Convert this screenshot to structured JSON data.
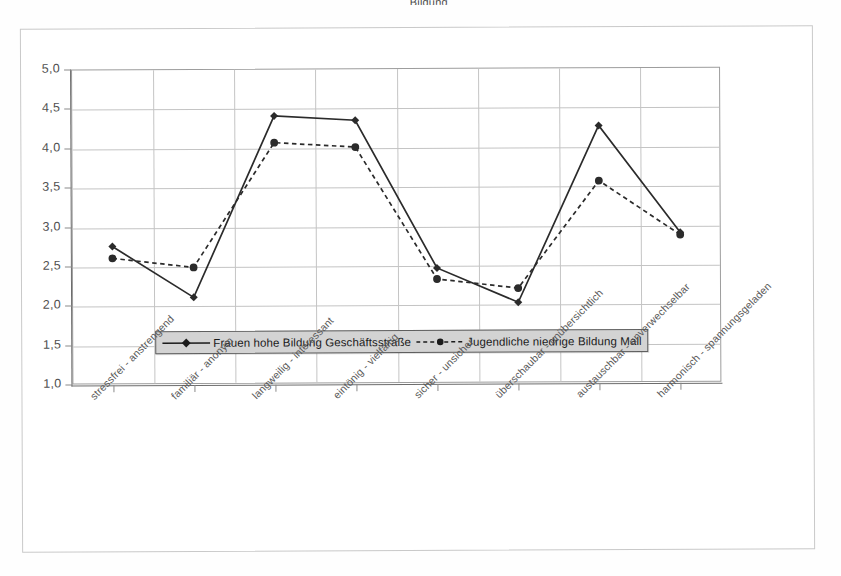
{
  "title_fragment": "Bildung",
  "axis": {
    "y_ticks": [
      "5,0",
      "4,5",
      "4,0",
      "3,5",
      "3,0",
      "2,5",
      "2,0",
      "1,5",
      "1,0"
    ],
    "y_min": 1.0,
    "y_max": 5.0,
    "y_step": 0.5
  },
  "legend": {
    "series1_label": "Frauen hohe Bildung Geschäftsstraße",
    "series2_label": "Jugendliche niedrige Bildung Mall"
  },
  "chart_data": {
    "type": "line",
    "title": "",
    "subtitle": "",
    "xlabel": "",
    "ylabel": "",
    "ylim": [
      1.0,
      5.0
    ],
    "ytick_step": 0.5,
    "ytick_labels": [
      "1,0",
      "1,5",
      "2,0",
      "2,5",
      "3,0",
      "3,5",
      "4,0",
      "4,5",
      "5,0"
    ],
    "grid": "both",
    "legend_position": "inside-center-lower",
    "categories": [
      "stressfrei - anstrengend",
      "familiär - anonym",
      "langweilig - interessant",
      "eintönig - vielfältig",
      "sicher - unsicher",
      "überschaubar - unübersichtlich",
      "austauschbar - unverwechselbar",
      "harmonisch - spannungsgeladen"
    ],
    "series": [
      {
        "name": "Frauen hohe Bildung Geschäftsstraße",
        "style": "solid",
        "marker": "diamond",
        "color": "#2b2b2b",
        "values": [
          2.75,
          2.1,
          4.4,
          4.34,
          2.46,
          2.02,
          4.26,
          2.9
        ]
      },
      {
        "name": "Jugendliche niedrige Bildung Mall",
        "style": "dashed",
        "marker": "circle",
        "color": "#2b2b2b",
        "values": [
          2.6,
          2.48,
          4.06,
          4.0,
          2.32,
          2.2,
          3.56,
          2.87
        ]
      }
    ]
  }
}
